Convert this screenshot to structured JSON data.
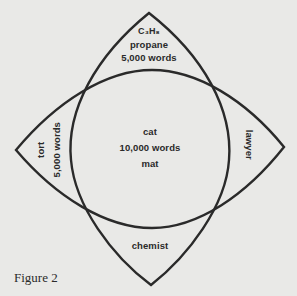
{
  "figure": {
    "caption": "Figure 2",
    "line_color": "#2a2a2a",
    "background_color": "#e9e9e7",
    "regions": {
      "top": {
        "formula": "C₃H₈",
        "word": "propane",
        "count": "5,000 words"
      },
      "center": {
        "word1": "cat",
        "count": "10,000 words",
        "word2": "mat"
      },
      "left": {
        "word": "tort",
        "count": "5,000 words"
      },
      "right": {
        "word": "lawyer"
      },
      "bottom": {
        "word": "chemist"
      }
    }
  }
}
